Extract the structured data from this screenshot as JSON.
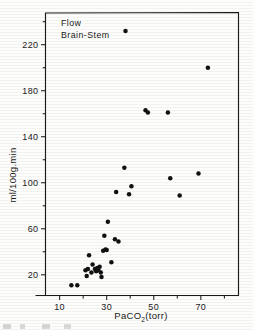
{
  "figure": {
    "annotation_line1": "Flow",
    "annotation_line2": "Brain-Stem",
    "xlabel_main": "PaCO",
    "xlabel_sub": "2",
    "xlabel_unit": "(torr)",
    "ylabel": "ml/100g.min",
    "frame_color": "#1a1a1a",
    "point_color": "#111111"
  },
  "chart_data": {
    "type": "scatter",
    "title": "Flow Brain-Stem",
    "xlabel": "PaCO2(torr)",
    "ylabel": "ml/100g.min",
    "xlim": [
      4,
      86
    ],
    "ylim": [
      2,
      248
    ],
    "xticks": [
      10,
      30,
      50,
      70
    ],
    "xticklabels": [
      "10",
      "30",
      "50",
      "70"
    ],
    "xminorticks": [
      20,
      40,
      60,
      80
    ],
    "yticks": [
      20,
      60,
      100,
      140,
      180,
      220
    ],
    "yticklabels": [
      "20",
      "60",
      "100",
      "140",
      "180",
      "220"
    ],
    "yminorticks": [
      40,
      80,
      120,
      160,
      200,
      240
    ],
    "grid": false,
    "legend": "none",
    "marker": "filled-circle",
    "series": [
      {
        "name": "Brain-Stem Flow",
        "points": [
          [
            15,
            11
          ],
          [
            17.5,
            11
          ],
          [
            21,
            24
          ],
          [
            21.5,
            19
          ],
          [
            22,
            25
          ],
          [
            22.5,
            37
          ],
          [
            23.5,
            22
          ],
          [
            24,
            29
          ],
          [
            25,
            25
          ],
          [
            25.5,
            23
          ],
          [
            26,
            26
          ],
          [
            26.5,
            24
          ],
          [
            27,
            27
          ],
          [
            27.5,
            22
          ],
          [
            27.8,
            18
          ],
          [
            28.5,
            41
          ],
          [
            29.5,
            42
          ],
          [
            30,
            41.5
          ],
          [
            29,
            54
          ],
          [
            30.5,
            66
          ],
          [
            32,
            31
          ],
          [
            33.5,
            51
          ],
          [
            35,
            49
          ],
          [
            34,
            92
          ],
          [
            37.5,
            113
          ],
          [
            39.5,
            90
          ],
          [
            40.5,
            97
          ],
          [
            38,
            232
          ],
          [
            46.5,
            163
          ],
          [
            47.5,
            161
          ],
          [
            56,
            161
          ],
          [
            57,
            104
          ],
          [
            61,
            89
          ],
          [
            69,
            108
          ],
          [
            73,
            200
          ]
        ]
      }
    ]
  }
}
